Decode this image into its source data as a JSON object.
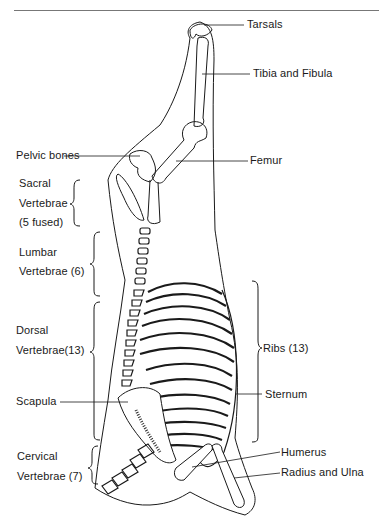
{
  "figure": {
    "labels": {
      "tarsals": "Tarsals",
      "tibia_fibula": "Tibia and Fibula",
      "pelvic_bones": "Pelvic bones",
      "femur": "Femur",
      "sacral_1": "Sacral",
      "sacral_2": "Vertebrae",
      "sacral_3": "(5 fused)",
      "lumbar_1": "Lumbar",
      "lumbar_2": "Vertebrae (6)",
      "dorsal_1": "Dorsal",
      "dorsal_2": "Vertebrae(13)",
      "ribs": "Ribs (13)",
      "sternum": "Sternum",
      "scapula": "Scapula",
      "cervical_1": "Cervical",
      "cervical_2": "Vertebrae (7)",
      "humerus": "Humerus",
      "radius_ulna": "Radius and Ulna"
    },
    "line_color": "#1a1a1a",
    "background": "#ffffff"
  }
}
